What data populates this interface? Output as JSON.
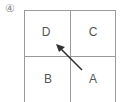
{
  "figure": {
    "number_label": "④",
    "cells": {
      "top_left": "D",
      "top_right": "C",
      "bottom_left": "B",
      "bottom_right": "A"
    },
    "arrow": {
      "from": "A",
      "to": "D"
    },
    "line_color": "#9a9a9a",
    "arrow_color": "#333333"
  }
}
